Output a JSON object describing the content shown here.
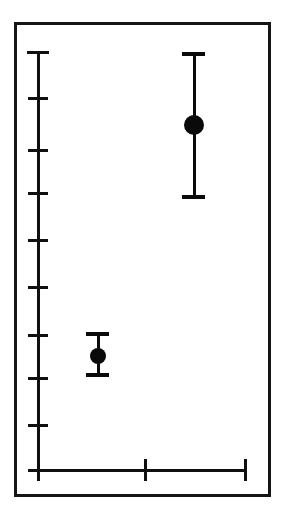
{
  "figure": {
    "title": "",
    "background_color": "#ffffff",
    "ink_color": "#101010",
    "frame": {
      "left": 14,
      "top": 22,
      "width": 257,
      "height": 475,
      "border_width": 3,
      "color": "#151515"
    }
  },
  "chart_data": {
    "type": "scatter",
    "title": "",
    "subtitle": "",
    "xlabel": "",
    "ylabel": "",
    "grid": false,
    "legend": null,
    "legend_position": "none",
    "style": "point-with-error-bars",
    "x_axis": {
      "label": "",
      "tick_labels": [
        "",
        "",
        ""
      ],
      "tick_count": 3,
      "axis_line_y_px": 470,
      "axis_start_x_px": 38,
      "axis_end_x_px": 245,
      "tick_positions_px": [
        38,
        145,
        245
      ],
      "categories": [
        "group-1",
        "group-2"
      ],
      "category_positions_px": [
        98,
        194
      ]
    },
    "y_axis": {
      "label": "",
      "tick_labels": [
        "",
        "",
        "",
        "",
        "",
        "",
        "",
        "",
        "",
        ""
      ],
      "tick_count": 10,
      "axis_line_x_px": 38,
      "axis_top_y_px": 52,
      "axis_bottom_y_px": 470,
      "tick_positions_px": [
        52,
        98,
        150,
        193,
        240,
        287,
        335,
        378,
        425,
        470
      ],
      "ylim_units": [
        0,
        9
      ],
      "units_per_tick": 1
    },
    "series": [
      {
        "name": "group-1",
        "marker": "filled-circle",
        "marker_diameter_px": 16,
        "color": "#0a0a0a",
        "x_px": 98,
        "y_px": 356,
        "value_units": 2.45,
        "error_low_units": 1.99,
        "error_high_units": 2.9,
        "error_top_y_px": 333,
        "error_bottom_y_px": 375,
        "cap_width_px": 23
      },
      {
        "name": "group-2",
        "marker": "filled-circle",
        "marker_diameter_px": 20,
        "color": "#0a0a0a",
        "x_px": 194,
        "y_px": 125,
        "value_units": 7.4,
        "error_low_units": 5.85,
        "error_high_units": 8.95,
        "error_top_y_px": 53,
        "error_bottom_y_px": 197,
        "cap_width_px": 23
      }
    ]
  }
}
